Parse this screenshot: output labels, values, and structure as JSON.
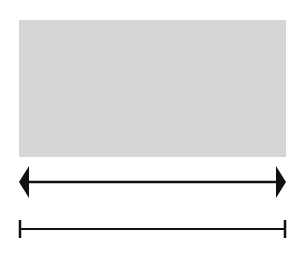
{
  "diagram": {
    "shapes": [
      {
        "type": "rectangle",
        "fill": "#d4d5d7",
        "label": ""
      },
      {
        "type": "double-headed-arrow",
        "color": "#111111",
        "label": ""
      },
      {
        "type": "line-segment",
        "color": "#111111",
        "label": ""
      }
    ]
  }
}
